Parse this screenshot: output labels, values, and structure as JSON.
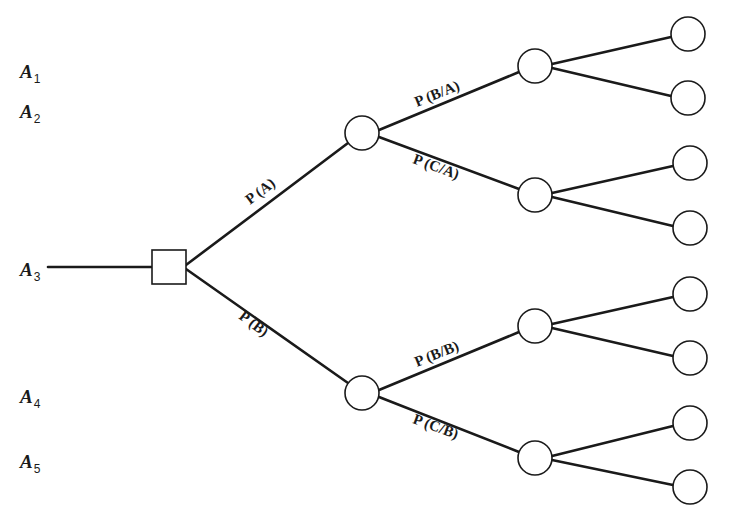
{
  "diagram": {
    "type": "decision-tree",
    "alternatives": [
      {
        "id": "A1",
        "letter": "A",
        "subscript": "1",
        "x": 20,
        "y": 62
      },
      {
        "id": "A2",
        "letter": "A",
        "subscript": "2",
        "x": 20,
        "y": 102
      },
      {
        "id": "A3",
        "letter": "A",
        "subscript": "3",
        "x": 20,
        "y": 260
      },
      {
        "id": "A4",
        "letter": "A",
        "subscript": "4",
        "x": 20,
        "y": 387
      },
      {
        "id": "A5",
        "letter": "A",
        "subscript": "5",
        "x": 20,
        "y": 452
      }
    ],
    "root": {
      "shape": "square",
      "label": "decision-node",
      "cx": 169,
      "cy": 267,
      "size": 34
    },
    "branches": [
      {
        "id": "p_a",
        "label": "P (A)",
        "from": "root",
        "to": "chance_a"
      },
      {
        "id": "p_b",
        "label": "P (B)",
        "from": "root",
        "to": "chance_b"
      },
      {
        "id": "p_b_given_a",
        "label": "P (B/A)",
        "from": "chance_a",
        "to": "chance_ab"
      },
      {
        "id": "p_c_given_a",
        "label": "P (C/A)",
        "from": "chance_a",
        "to": "chance_ac"
      },
      {
        "id": "p_b_given_b",
        "label": "P (B/B)",
        "from": "chance_b",
        "to": "chance_bb"
      },
      {
        "id": "p_c_given_b",
        "label": "P (C/B)",
        "from": "chance_b",
        "to": "chance_bc"
      }
    ],
    "chance_nodes": {
      "level1": [
        {
          "id": "chance_a",
          "cx": 362,
          "cy": 133
        },
        {
          "id": "chance_b",
          "cx": 362,
          "cy": 393
        }
      ],
      "level2": [
        {
          "id": "chance_ab",
          "cx": 535,
          "cy": 66
        },
        {
          "id": "chance_ac",
          "cx": 535,
          "cy": 195
        },
        {
          "id": "chance_bb",
          "cx": 535,
          "cy": 326
        },
        {
          "id": "chance_bc",
          "cx": 535,
          "cy": 458
        }
      ],
      "terminal_count": 8
    },
    "colors": {
      "line": "#1a1a1a",
      "background": "#ffffff"
    }
  }
}
